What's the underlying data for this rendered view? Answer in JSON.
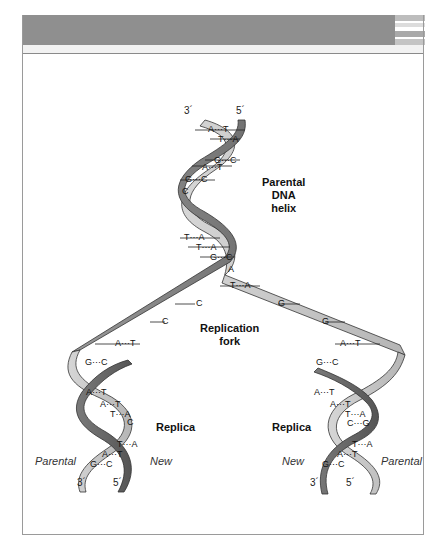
{
  "figure": {
    "title_labels": {
      "parental_helix": "Parental\nDNA\nhelix",
      "replication_fork": "Replication\nfork",
      "replica_left": "Replica",
      "replica_right": "Replica"
    },
    "strand_labels": {
      "left_parental": "Parental",
      "left_new": "New",
      "right_new": "New",
      "right_parental": "Parental"
    },
    "ends": {
      "top_left": "3´",
      "top_right": "5´",
      "bottom_left_3": "3´",
      "bottom_left_5": "5´",
      "bottom_right_3": "3´",
      "bottom_right_5": "5´"
    },
    "parental_pairs": [
      "A···T",
      "T···A",
      "G···C",
      "A···T",
      "G···C",
      "C",
      "T···A",
      "T···A",
      "G···C",
      "A",
      "T···A"
    ],
    "left_arm_bases": [
      "C",
      "C",
      "A···T"
    ],
    "right_arm_bases": [
      "G",
      "G",
      "A···T"
    ],
    "left_replica_pairs": [
      "G···C",
      "A···T",
      "A···T",
      "T···A",
      "C",
      "T···A",
      "A···T",
      "G···C"
    ],
    "right_replica_pairs": [
      "G···C",
      "A···T",
      "A···T",
      "T···A",
      "C···G",
      "T···A",
      "A···T",
      "G···C"
    ],
    "colors": {
      "parental_strand_light": "#c8c8c8",
      "parental_strand_dark": "#8c8c8c",
      "new_strand": "#6e6e6e",
      "header": "#8f8f8f"
    }
  }
}
